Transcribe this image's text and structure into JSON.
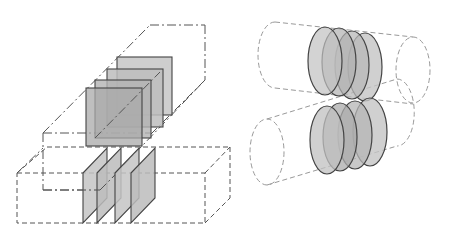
{
  "figure": {
    "left_panel": {
      "description": "Two stacked rectangular boxes with inserted plates",
      "upper_box": {
        "line_style": "dash-dot",
        "plate_count": 4,
        "plate_shape": "square"
      },
      "lower_box": {
        "line_style": "dashed",
        "plate_count": 4,
        "plate_shape": "thin-parallelogram"
      }
    },
    "right_panel": {
      "description": "Two parallel cylinders with stacked elliptical discs",
      "upper_cylinder": {
        "line_style": "dashed",
        "disc_count": 4
      },
      "lower_cylinder": {
        "line_style": "dashed",
        "disc_count": 4
      }
    },
    "colors": {
      "plate_fill": "#b8b8b8",
      "disc_fill": "#b0b0b0",
      "outline": "#444444",
      "guide_line": "#555555",
      "cylinder_line": "#999999",
      "background": "#ffffff"
    }
  }
}
